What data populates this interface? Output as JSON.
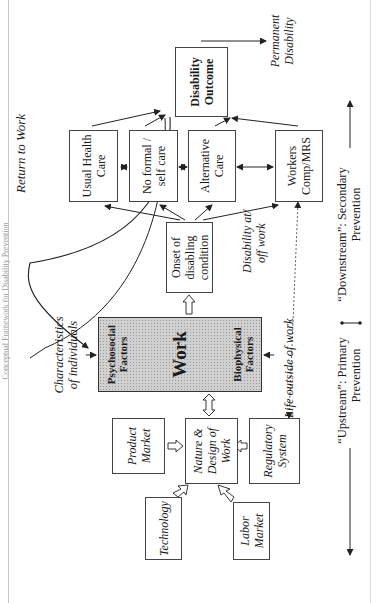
{
  "page": {
    "caption": "Conceptual Framework for Disability Prevention"
  },
  "diagram": {
    "return_to_work": "Return to Work",
    "disability_outcome": [
      "Disability",
      "Outcome"
    ],
    "permanent_disability": [
      "Permanent",
      "Disability"
    ],
    "usual_health_care": [
      "Usual Health",
      "Care"
    ],
    "no_formal_self_care": [
      "No formal /",
      "self care"
    ],
    "alternative_care": [
      "Alternative",
      "Care"
    ],
    "workers_comp": [
      "Workers",
      "Comp/MRS"
    ],
    "onset": [
      "Onset of",
      "disabling",
      "condition"
    ],
    "disability_at_off_work": [
      "Disability at/",
      "off work"
    ],
    "characteristics": [
      "Characteristics",
      "of individuals"
    ],
    "work": {
      "title": "Work",
      "psychosocial": [
        "Psychosocial",
        "Factors"
      ],
      "biophysical": [
        "Biophysical",
        "Factors"
      ]
    },
    "life_outside_work": "Life outside of work",
    "product_market": [
      "Product",
      "Market"
    ],
    "nature_design": [
      "Nature &",
      "Design of",
      "Work"
    ],
    "regulatory_system": [
      "Regulatory",
      "System"
    ],
    "technology": "Technology",
    "labor_market": [
      "Labor",
      "Market"
    ],
    "upstream": [
      "“Upstream”: Primary",
      "Prevention"
    ],
    "downstream": [
      "“Downstream”: Secondary",
      "Prevention"
    ]
  },
  "colors": {
    "line": "#222222",
    "work_fill": "#d0d0d0",
    "border": "#444444"
  }
}
